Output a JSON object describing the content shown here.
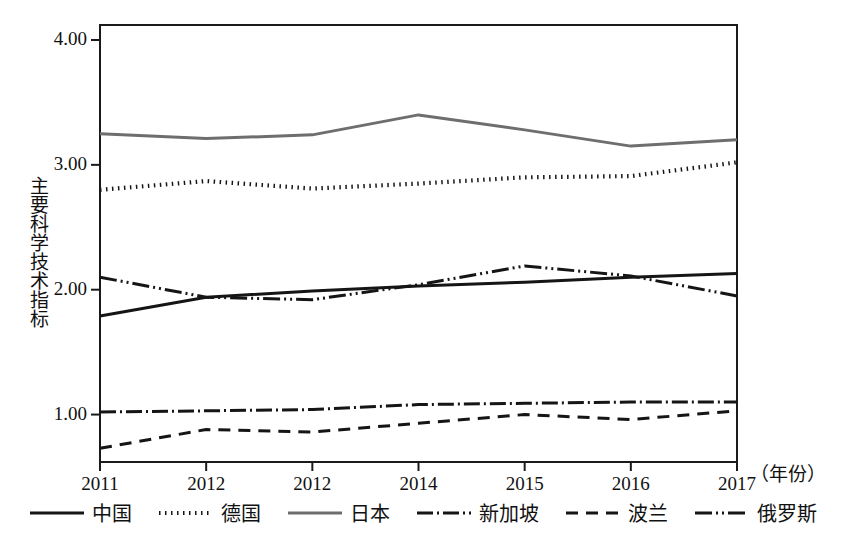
{
  "chart_data": {
    "type": "line",
    "title": "",
    "xlabel": "年份",
    "ylabel": "主要科学技术指标",
    "x": [
      "2011",
      "2012",
      "2012",
      "2014",
      "2015",
      "2016",
      "2017"
    ],
    "categories": [
      "2011",
      "2012",
      "2012",
      "2014",
      "2015",
      "2016",
      "2017"
    ],
    "xtick_labels": [
      "2011",
      "2012",
      "2012",
      "2014",
      "2015",
      "2016",
      "2017"
    ],
    "ytick_labels": [
      "1.00",
      "2.00",
      "3.00",
      "4.00"
    ],
    "ytick_values": [
      1.0,
      2.0,
      3.0,
      4.0
    ],
    "ylim": [
      0.62,
      4.12
    ],
    "xlim": [
      0,
      6
    ],
    "grid": false,
    "legend_position": "bottom",
    "series": [
      {
        "name": "中国",
        "values": [
          1.79,
          1.94,
          1.99,
          2.03,
          2.06,
          2.1,
          2.13
        ],
        "style": "solid",
        "color": "#151515"
      },
      {
        "name": "德国",
        "values": [
          2.8,
          2.87,
          2.81,
          2.85,
          2.9,
          2.91,
          3.02
        ],
        "style": "dotted",
        "color": "#151515"
      },
      {
        "name": "日本",
        "values": [
          3.25,
          3.21,
          3.24,
          3.4,
          3.28,
          3.15,
          3.2
        ],
        "style": "solid",
        "color": "#6e6e6e"
      },
      {
        "name": "新加坡",
        "values": [
          1.02,
          1.03,
          1.04,
          1.08,
          1.09,
          1.1,
          1.1
        ],
        "style": "dash-dot",
        "color": "#151515"
      },
      {
        "name": "波兰",
        "values": [
          0.73,
          0.88,
          0.86,
          0.93,
          1.0,
          0.96,
          1.03
        ],
        "style": "dashed",
        "color": "#151515"
      },
      {
        "name": "俄罗斯",
        "values": [
          2.1,
          1.94,
          1.92,
          2.04,
          2.19,
          2.11,
          1.95
        ],
        "style": "dash-dot-dot",
        "color": "#151515"
      }
    ]
  },
  "axis": {
    "y_title": "主要科学技术指标",
    "x_unit": "（年份）"
  },
  "legend": {
    "items": [
      {
        "label": "中国",
        "style": "solid"
      },
      {
        "label": "德国",
        "style": "dotted"
      },
      {
        "label": "日本",
        "style": "solid-gray"
      },
      {
        "label": "新加坡",
        "style": "dash-dot"
      },
      {
        "label": "波兰",
        "style": "dashed"
      },
      {
        "label": "俄罗斯",
        "style": "dash-dot-dot"
      }
    ]
  }
}
